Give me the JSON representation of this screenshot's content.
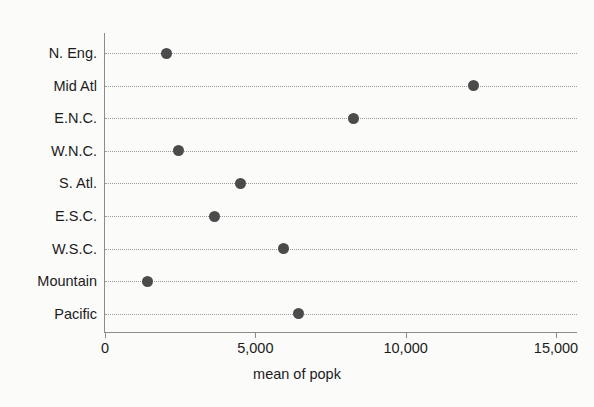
{
  "chart_data": {
    "type": "scatter",
    "subtype": "dot-plot",
    "title": "",
    "xlabel": "mean of popk",
    "ylabel": "",
    "categories": [
      "N. Eng.",
      "Mid Atl",
      "E.N.C.",
      "W.N.C.",
      "S. Atl.",
      "E.S.C.",
      "W.S.C.",
      "Mountain",
      "Pacific"
    ],
    "values": [
      2060,
      12240,
      8250,
      2430,
      4520,
      3630,
      5950,
      1430,
      6420
    ],
    "series": [
      {
        "name": "mean of popk",
        "values": [
          2060,
          12240,
          8250,
          2430,
          4520,
          3630,
          5950,
          1430,
          6420
        ]
      }
    ],
    "xlim": [
      0,
      15000
    ],
    "xticks": [
      0,
      5000,
      10000,
      15000
    ],
    "xticklabels": [
      "0",
      "5,000",
      "10,000",
      "15,000"
    ],
    "grid": "horizontal-dotted",
    "legend": "none",
    "marker": "filled-circle",
    "marker_color": "#4b4b4b",
    "axis_color": "#8c8c8c",
    "grid_color": "#9a9a9a",
    "background_color": "#fbfbfa"
  }
}
